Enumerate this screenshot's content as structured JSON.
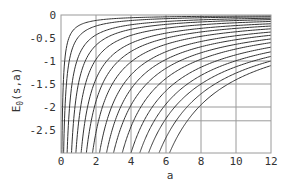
{
  "chart_data": {
    "type": "line",
    "title": "",
    "xlabel": "a",
    "ylabel": "E0(s,a)",
    "ylabel_main": "E",
    "ylabel_sub": "0",
    "ylabel_args": "(s,a)",
    "xlim": [
      0,
      12
    ],
    "ylim": [
      -3,
      0
    ],
    "x_ticks": [
      0,
      2,
      4,
      6,
      8,
      10,
      12
    ],
    "x_tick_labels": [
      "0",
      "2",
      "4",
      "6",
      "8",
      "10",
      "12"
    ],
    "y_ticks": [
      0,
      -0.5,
      -1,
      -1.5,
      -2,
      -2.5
    ],
    "y_tick_labels": [
      "0",
      "-0.5",
      "-1",
      "-1.5",
      "-2",
      "-2.5"
    ],
    "grid": true,
    "grid_x": [
      2,
      4,
      6,
      8,
      10
    ],
    "grid_y": [
      -1,
      -1.5,
      -2,
      -2.3
    ],
    "legend": null,
    "series_description": "Family of curves; each rises steeply from the bottom of the plot and approaches 0 as a increases",
    "series": [
      {
        "name": "curve-1",
        "bottom_crossing_a": 0.05,
        "value_at_a12": -0.02
      },
      {
        "name": "curve-2",
        "bottom_crossing_a": 0.15,
        "value_at_a12": -0.04
      },
      {
        "name": "curve-3",
        "bottom_crossing_a": 0.35,
        "value_at_a12": -0.07
      },
      {
        "name": "curve-4",
        "bottom_crossing_a": 0.6,
        "value_at_a12": -0.1
      },
      {
        "name": "curve-5",
        "bottom_crossing_a": 0.85,
        "value_at_a12": -0.14
      },
      {
        "name": "curve-6",
        "bottom_crossing_a": 1.15,
        "value_at_a12": -0.19
      },
      {
        "name": "curve-7",
        "bottom_crossing_a": 1.45,
        "value_at_a12": -0.24
      },
      {
        "name": "curve-8",
        "bottom_crossing_a": 1.8,
        "value_at_a12": -0.3
      },
      {
        "name": "curve-9",
        "bottom_crossing_a": 2.2,
        "value_at_a12": -0.37
      },
      {
        "name": "curve-10",
        "bottom_crossing_a": 2.6,
        "value_at_a12": -0.44
      },
      {
        "name": "curve-11",
        "bottom_crossing_a": 3.0,
        "value_at_a12": -0.52
      },
      {
        "name": "curve-12",
        "bottom_crossing_a": 3.5,
        "value_at_a12": -0.6
      },
      {
        "name": "curve-13",
        "bottom_crossing_a": 4.0,
        "value_at_a12": -0.7
      },
      {
        "name": "curve-14",
        "bottom_crossing_a": 4.5,
        "value_at_a12": -0.8
      },
      {
        "name": "curve-15",
        "bottom_crossing_a": 5.0,
        "value_at_a12": -0.9
      },
      {
        "name": "curve-16",
        "bottom_crossing_a": 5.6,
        "value_at_a12": -1.0
      },
      {
        "name": "curve-17",
        "bottom_crossing_a": 6.2,
        "value_at_a12": -1.1
      }
    ],
    "colors": {
      "curve": "#333333",
      "grid": "#9a9a9a",
      "frame": "#9a9a9a",
      "text": "#333333"
    }
  }
}
